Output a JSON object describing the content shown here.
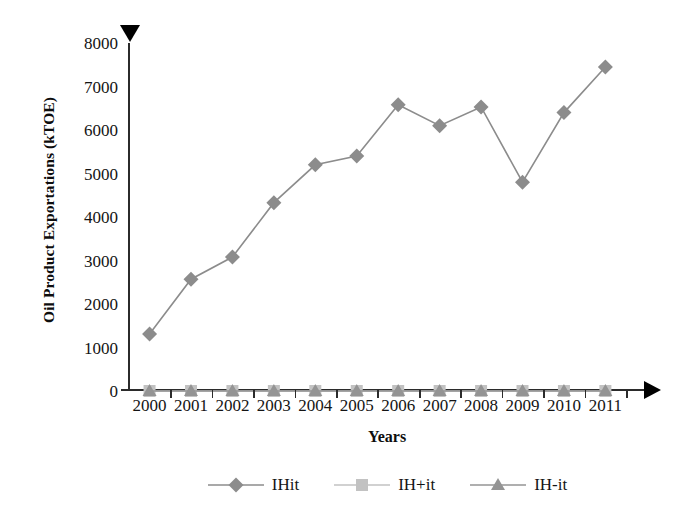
{
  "chart_data": {
    "type": "line",
    "title": "",
    "xlabel": "Years",
    "ylabel": "Oil Product Exportations (kTOE)",
    "categories": [
      "2000",
      "2001",
      "2002",
      "2003",
      "2004",
      "2005",
      "2006",
      "2007",
      "2008",
      "2009",
      "2010",
      "2011"
    ],
    "ylim": [
      0,
      8000
    ],
    "yticks": [
      0,
      1000,
      2000,
      3000,
      4000,
      5000,
      6000,
      7000,
      8000
    ],
    "ytick_labels": [
      "0",
      "1000",
      "2000",
      "3000",
      "4000",
      "5000",
      "6000",
      "7000",
      "8000"
    ],
    "grid": false,
    "legend_position": "bottom",
    "series": [
      {
        "name": "IHit",
        "marker": "diamond",
        "color": "#8c8c8c",
        "values": [
          1310,
          2570,
          3080,
          4330,
          5200,
          5400,
          6580,
          6100,
          6530,
          4800,
          6400,
          7450
        ]
      },
      {
        "name": "IH+it",
        "marker": "square",
        "color": "#c2c2c2",
        "values": [
          0,
          0,
          0,
          0,
          0,
          0,
          0,
          0,
          0,
          0,
          0,
          0
        ]
      },
      {
        "name": "IH-it",
        "marker": "triangle",
        "color": "#949494",
        "values": [
          0,
          0,
          0,
          0,
          0,
          0,
          0,
          0,
          0,
          0,
          0,
          0
        ]
      }
    ]
  },
  "axis": {
    "y_arrow_icon": "triangle-down-icon",
    "x_arrow_icon": "triangle-right-icon"
  }
}
